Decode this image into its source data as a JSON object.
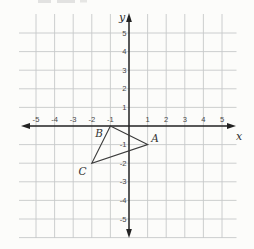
{
  "figure": {
    "background_color": "#fcfcfa",
    "grid_color": "#c6c8ca",
    "axis_color": "#222222",
    "tick_label_color": "#474747",
    "triangle_color": "#3b3b3b",
    "x_axis_label": "x",
    "y_axis_label": "y",
    "x_ticks": [
      "-5",
      "-4",
      "-3",
      "-2",
      "-1",
      "1",
      "2",
      "3",
      "4",
      "5"
    ],
    "y_ticks": [
      "5",
      "4",
      "3",
      "2",
      "1",
      "-1",
      "-2",
      "-3",
      "-4",
      "-5"
    ]
  },
  "chart_data": {
    "type": "scatter",
    "shape": "closed triangle polygon through points A, B, C",
    "points": [
      {
        "label": "A",
        "x": 1,
        "y": -1
      },
      {
        "label": "B",
        "x": -1,
        "y": 0
      },
      {
        "label": "C",
        "x": -2,
        "y": -2
      }
    ],
    "xlabel": "x",
    "ylabel": "y",
    "xlim": [
      -6,
      6
    ],
    "ylim": [
      -6,
      6
    ],
    "x_tick_values": [
      -5,
      -4,
      -3,
      -2,
      -1,
      1,
      2,
      3,
      4,
      5
    ],
    "y_tick_values": [
      5,
      4,
      3,
      2,
      1,
      -1,
      -2,
      -3,
      -4,
      -5
    ],
    "grid": true,
    "legend": "none"
  }
}
